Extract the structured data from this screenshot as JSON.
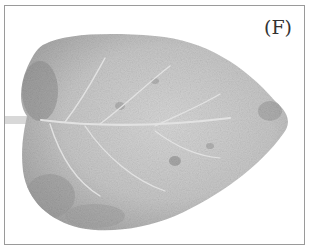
{
  "figure": {
    "panel_label": "(F)",
    "colors": {
      "leaf_light": "#cfcfcf",
      "leaf_mid": "#b3b3b3",
      "leaf_dark": "#8e8e8e",
      "vein": "#e4e4e4",
      "border": "#9a9a9a"
    }
  }
}
